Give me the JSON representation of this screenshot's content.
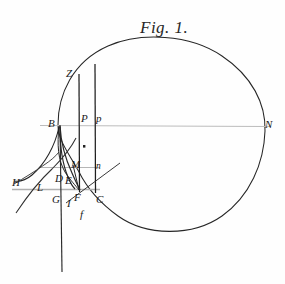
{
  "figure": {
    "title": "Fig. 1.",
    "title_position": {
      "x": 140,
      "y": 18
    },
    "background_color": "#fefefe",
    "ink_color": "#1a1a1a",
    "faint_ink_color": "#b8b8b8",
    "width": 285,
    "height": 284
  },
  "labels": [
    {
      "id": "label-Z",
      "text": "Z",
      "x": 66,
      "y": 68,
      "size": "normal"
    },
    {
      "id": "label-B",
      "text": "B",
      "x": 48,
      "y": 118,
      "size": "normal"
    },
    {
      "id": "label-P-upper",
      "text": "P",
      "x": 81,
      "y": 113,
      "size": "normal"
    },
    {
      "id": "label-p-lower",
      "text": "p",
      "x": 96,
      "y": 113,
      "size": "normal"
    },
    {
      "id": "label-N",
      "text": "N",
      "x": 265,
      "y": 119,
      "size": "normal"
    },
    {
      "id": "label-M",
      "text": "M",
      "x": 71,
      "y": 159,
      "size": "normal"
    },
    {
      "id": "label-n",
      "text": "n",
      "x": 96,
      "y": 162,
      "size": "small"
    },
    {
      "id": "label-H",
      "text": "H",
      "x": 12,
      "y": 177,
      "size": "normal"
    },
    {
      "id": "label-L",
      "text": "L",
      "x": 37,
      "y": 182,
      "size": "normal"
    },
    {
      "id": "label-D",
      "text": "D",
      "x": 55,
      "y": 173,
      "size": "normal"
    },
    {
      "id": "label-E",
      "text": "E",
      "x": 65,
      "y": 175,
      "size": "normal"
    },
    {
      "id": "label-G",
      "text": "G",
      "x": 52,
      "y": 194,
      "size": "normal"
    },
    {
      "id": "label-I",
      "text": "I",
      "x": 67,
      "y": 198,
      "size": "normal"
    },
    {
      "id": "label-F",
      "text": "F",
      "x": 74,
      "y": 192,
      "size": "normal"
    },
    {
      "id": "label-C",
      "text": "C",
      "x": 96,
      "y": 194,
      "size": "normal"
    },
    {
      "id": "label-f",
      "text": "f",
      "x": 80,
      "y": 209,
      "size": "normal"
    }
  ],
  "chart_data": {
    "type": "diagram",
    "title": "Fig. 1.",
    "points": [
      {
        "name": "Z",
        "x": 72,
        "y": 76
      },
      {
        "name": "B",
        "x": 58,
        "y": 125
      },
      {
        "name": "P",
        "x": 80,
        "y": 125
      },
      {
        "name": "p",
        "x": 95,
        "y": 125
      },
      {
        "name": "N",
        "x": 262,
        "y": 126
      },
      {
        "name": "M",
        "x": 75,
        "y": 167
      },
      {
        "name": "n",
        "x": 97,
        "y": 168
      },
      {
        "name": "H",
        "x": 14,
        "y": 180
      },
      {
        "name": "L",
        "x": 40,
        "y": 184
      },
      {
        "name": "D",
        "x": 58,
        "y": 178
      },
      {
        "name": "E",
        "x": 68,
        "y": 180
      },
      {
        "name": "G",
        "x": 56,
        "y": 190
      },
      {
        "name": "I",
        "x": 70,
        "y": 190
      },
      {
        "name": "F",
        "x": 79,
        "y": 190
      },
      {
        "name": "C",
        "x": 96,
        "y": 190
      },
      {
        "name": "f",
        "x": 84,
        "y": 205
      },
      {
        "name": "dot-marker",
        "x": 84,
        "y": 146
      }
    ],
    "axis_line": {
      "from": "B",
      "to": "N",
      "y": 126,
      "x_start": 40,
      "x_end": 268
    },
    "ordinates": [
      {
        "name": "PF",
        "x": 79,
        "y_top": 76,
        "y_bottom": 190
      },
      {
        "name": "pC",
        "x": 95,
        "y_top": 66,
        "y_bottom": 191
      }
    ],
    "horizontals": [
      {
        "name": "Mn-line",
        "y": 168,
        "x_start": 40,
        "x_end": 99
      },
      {
        "name": "HGC-line",
        "y": 190,
        "x_start": 14,
        "x_end": 99
      }
    ],
    "oval": {
      "cx": 160,
      "cy": 132,
      "rx": 105,
      "ry": 92
    }
  }
}
